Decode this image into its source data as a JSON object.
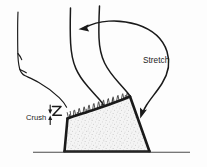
{
  "figure": {
    "background_color": "#fdfdfd",
    "ink_color": "#1a1a1a",
    "ground_color": "#4a4a4a",
    "hoof_fill_color": "#f2f2f2",
    "stipple_color": "#9a9a9a"
  },
  "labels": {
    "stretch": "Stretch",
    "crush": "Crush"
  },
  "icons": {
    "compression": "compression-z-symbol",
    "stretch_arrow": "curved-stretch-arrow",
    "upper_arrowhead": "arrowhead-left",
    "lower_arrowhead": "arrowhead-down-left"
  },
  "shapes": {
    "background_leg": "background-leg-outline",
    "main_leg": "main-leg-s-curve",
    "hoof": "hoof-quadrilateral",
    "fur": "fur-bristles",
    "ground": "ground-line"
  }
}
